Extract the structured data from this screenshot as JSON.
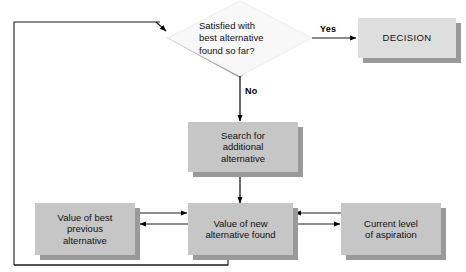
{
  "diagram": {
    "colors": {
      "box_fill": "#c6c6c6",
      "box_fill_light": "#dedede",
      "box_shadow": "#9a9a9a",
      "diamond_fill": "#f7f7f7",
      "diamond_shadow": "#9a9a9a",
      "line": "#000000",
      "text": "#111111",
      "background": "#ffffff"
    },
    "nodes": {
      "decision_diamond": {
        "label": "Satisfied with\nbest alternative\nfound so far?",
        "shape": "diamond"
      },
      "decision_box": {
        "label": "DECISION",
        "shape": "rectangle"
      },
      "search_box": {
        "label": "Search for\nadditional\nalternative",
        "shape": "rectangle"
      },
      "previous_value_box": {
        "label": "Value of best\nprevious\nalternative",
        "shape": "rectangle"
      },
      "new_value_box": {
        "label": "Value of new\nalternative found",
        "shape": "rectangle"
      },
      "aspiration_box": {
        "label": "Current level\nof aspiration",
        "shape": "rectangle"
      }
    },
    "edge_labels": {
      "yes": "Yes",
      "no": "No"
    }
  }
}
